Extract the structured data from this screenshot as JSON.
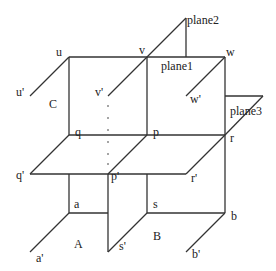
{
  "diagram": {
    "stroke_color": "#333333",
    "labels": {
      "u": "u",
      "v": "v",
      "w": "w",
      "u_prime": "u'",
      "v_prime": "v'",
      "w_prime": "w'",
      "q": "q",
      "p": "p",
      "r": "r",
      "q_prime": "q'",
      "p_prime": "p'",
      "r_prime": "r'",
      "a": "a",
      "s": "s",
      "b": "b",
      "a_prime": "a'",
      "s_prime": "s'",
      "b_prime": "b'",
      "region_A": "A",
      "region_B": "B",
      "region_C": "C",
      "plane1": "plane1",
      "plane2": "plane2",
      "plane3": "plane3"
    }
  }
}
